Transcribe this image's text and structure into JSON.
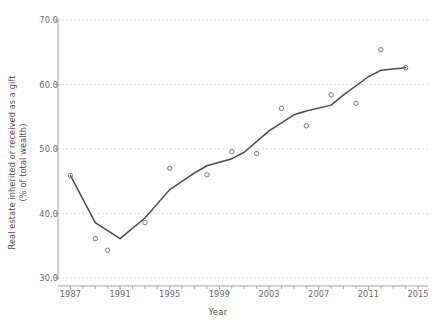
{
  "chart_data": {
    "type": "line",
    "title": "",
    "subtitle": "",
    "xlabel": "Year",
    "ylabel": "Real estate inherited or received as a gift",
    "ylabel_line2": "(% of total wealth)",
    "xlim": [
      1986,
      2015.8
    ],
    "ylim": [
      30.0,
      70.0
    ],
    "grid": true,
    "grid_axis": "y",
    "legend": "none",
    "yticks": [
      30.0,
      40.0,
      50.0,
      60.0,
      70.0
    ],
    "ytick_labels": [
      "30.0",
      "40.0",
      "50.0",
      "60.0",
      "70.0"
    ],
    "xticks": [
      1987,
      1991,
      1995,
      1999,
      2003,
      2007,
      2011,
      2015
    ],
    "xtick_labels": [
      "1987",
      "1991",
      "1995",
      "1999",
      "2003",
      "2007",
      "2011",
      "2015"
    ],
    "x_minor_ticks": [
      1988,
      1989,
      1990,
      1992,
      1993,
      1994,
      1996,
      1997,
      1998,
      2000,
      2001,
      2002,
      2004,
      2005,
      2006,
      2008,
      2009,
      2010,
      2012,
      2013,
      2014
    ],
    "series": [
      {
        "name": "observed",
        "type": "scatter",
        "marker": "open-circle",
        "color": "#7a7a7a",
        "x": [
          1987,
          1989,
          1990,
          1993,
          1995,
          1998,
          2000,
          2002,
          2004,
          2006,
          2008,
          2010,
          2012,
          2014
        ],
        "values": [
          45.9,
          36.1,
          34.3,
          38.6,
          47.0,
          46.0,
          49.6,
          49.3,
          56.3,
          53.6,
          58.4,
          57.1,
          65.4,
          62.6
        ]
      },
      {
        "name": "trend",
        "type": "line",
        "color": "#4a4a4a",
        "x": [
          1987,
          1989,
          1991,
          1993,
          1995,
          1997,
          1998,
          2000,
          2001,
          2003,
          2005,
          2006,
          2008,
          2009,
          2011,
          2012,
          2014
        ],
        "values": [
          45.9,
          38.6,
          36.1,
          39.3,
          43.7,
          46.3,
          47.4,
          48.5,
          49.5,
          52.8,
          55.3,
          55.9,
          56.8,
          58.4,
          61.2,
          62.2,
          62.6
        ]
      }
    ],
    "colors": {
      "line": "#4a4a4a",
      "marker_stroke": "#7a7a7a",
      "grid": "#d9d9e0",
      "axis": "#9a9a9a",
      "tick_text": "#6a6a6a",
      "label_text": "#4d4d4d",
      "background": "#ffffff"
    }
  }
}
